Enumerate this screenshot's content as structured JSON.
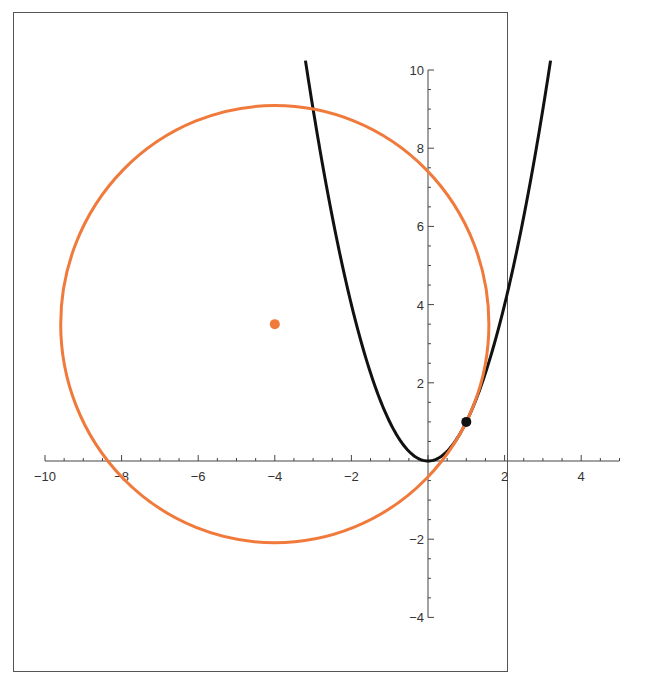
{
  "chart_data": {
    "type": "line",
    "title": "",
    "xlabel": "",
    "ylabel": "",
    "xlim": [
      -10,
      5
    ],
    "ylim": [
      -4,
      10
    ],
    "grid": false,
    "legend": null,
    "x_ticks": [
      -10,
      -8,
      -6,
      -4,
      -2,
      2,
      4
    ],
    "y_ticks": [
      -4,
      -2,
      2,
      4,
      6,
      8,
      10
    ],
    "series": [
      {
        "name": "parabola y = x^2",
        "kind": "curve",
        "equation": "y = x^2",
        "x_range": [
          -3.2,
          3.2
        ],
        "color": "#111111"
      },
      {
        "name": "circle",
        "kind": "circle",
        "center": [
          -4,
          3.5
        ],
        "radius": 5.59,
        "color": "#f07a3c"
      },
      {
        "name": "circle center",
        "kind": "point",
        "x": -4,
        "y": 3.5,
        "color": "#f07a3c"
      },
      {
        "name": "tangent point",
        "kind": "point",
        "x": 1,
        "y": 1,
        "color": "#111111"
      }
    ]
  },
  "colors": {
    "axis": "#444444",
    "frame": "#555555",
    "circle": "#f07a3c",
    "parabola": "#111111"
  }
}
